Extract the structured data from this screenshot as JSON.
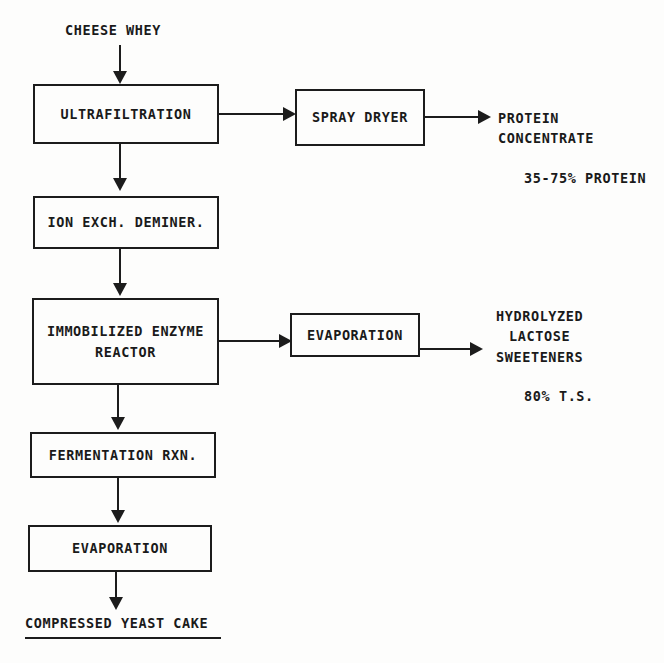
{
  "diagram": {
    "input_label": "CHEESE WHEY",
    "final_output_label": "COMPRESSED YEAST CAKE",
    "boxes": [
      {
        "id": "ultrafiltration",
        "lines": [
          "ULTRAFILTRATION"
        ]
      },
      {
        "id": "spray-dryer",
        "lines": [
          "SPRAY DRYER"
        ]
      },
      {
        "id": "ion-exchange",
        "lines": [
          "ION EXCH. DEMINER."
        ]
      },
      {
        "id": "enzyme-reactor",
        "lines": [
          "IMMOBILIZED ENZYME",
          "REACTOR"
        ]
      },
      {
        "id": "evaporation-right",
        "lines": [
          "EVAPORATION"
        ]
      },
      {
        "id": "fermentation",
        "lines": [
          "FERMENTATION RXN."
        ]
      },
      {
        "id": "evaporation-bottom",
        "lines": [
          "EVAPORATION"
        ]
      }
    ],
    "outputs": [
      {
        "id": "protein-concentrate",
        "lines": [
          "PROTEIN",
          "CONCENTRATE"
        ],
        "spec": "35-75% PROTEIN"
      },
      {
        "id": "lactose-sweeteners",
        "lines": [
          "HYDROLYZED",
          "LACTOSE",
          "SWEETENERS"
        ],
        "spec": "80% T.S."
      }
    ],
    "colors": {
      "ink": "#1c1c1c",
      "paper": "#fdfdfc"
    }
  }
}
